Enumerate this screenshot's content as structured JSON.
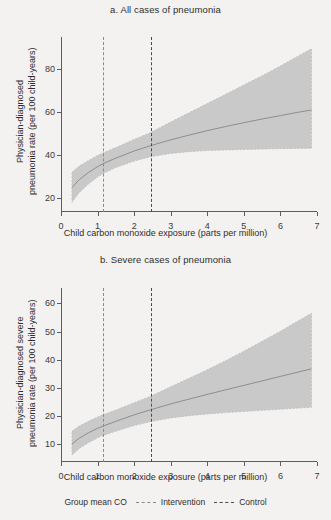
{
  "figure": {
    "background": "#f3f2f0",
    "band_color": "#c9c9c9",
    "line_color": "#8e8e8e",
    "axis_color": "#5d5d5d"
  },
  "legend": {
    "title": "Group mean CO",
    "items": [
      {
        "label": "Intervention",
        "style": "dashed",
        "color": "#8a8a8a"
      },
      {
        "label": "Control",
        "style": "dashed",
        "color": "#4a4a4a"
      }
    ]
  },
  "chart_data": [
    {
      "type": "line",
      "panel": "a",
      "title": "a. All cases of pneumonia",
      "xlabel": "Child carbon monoxide exposure (parts per million)",
      "ylabel": "Physician-diagnosed\npneumonia rate (per 100 child-years)",
      "xlim": [
        0,
        7
      ],
      "ylim": [
        13.5,
        95
      ],
      "xticks": [
        "0",
        "1",
        "2",
        "3",
        "4",
        "5",
        "6",
        "7"
      ],
      "yticks": [
        "20",
        "40",
        "60",
        "80"
      ],
      "grid": false,
      "legend_position": "bottom",
      "x": [
        0.3,
        0.5,
        0.75,
        1.0,
        1.15,
        1.5,
        2.0,
        2.45,
        3.0,
        3.5,
        4.0,
        4.5,
        5.0,
        5.5,
        6.0,
        6.5,
        6.85
      ],
      "series": [
        {
          "name": "Adjusted mean pneumonia rate",
          "values": [
            24.8,
            28.6,
            31.9,
            34.6,
            36.0,
            38.6,
            41.9,
            44.4,
            47.1,
            49.3,
            51.4,
            53.3,
            55.1,
            56.8,
            58.4,
            60.0,
            61.0
          ]
        },
        {
          "name": "95% CI lower",
          "values": [
            18.0,
            22.6,
            26.5,
            29.8,
            31.4,
            34.2,
            37.2,
            39.2,
            40.8,
            41.6,
            42.1,
            42.4,
            42.6,
            42.8,
            43.0,
            43.1,
            43.2
          ]
        },
        {
          "name": "95% CI upper",
          "values": [
            32.0,
            34.9,
            37.5,
            39.8,
            41.0,
            43.5,
            47.3,
            50.5,
            55.4,
            59.7,
            64.0,
            68.3,
            72.6,
            77.0,
            81.5,
            86.3,
            89.5
          ]
        }
      ],
      "reference_lines": [
        {
          "label": "Intervention",
          "value": 1.15,
          "style": "dashed"
        },
        {
          "label": "Control",
          "value": 2.45,
          "style": "dashed"
        }
      ]
    },
    {
      "type": "line",
      "panel": "b",
      "title": "b. Severe cases of pneumonia",
      "xlabel": "Child carbon monoxide exposure (parts per million)",
      "ylabel": "Physician-diagnosed severe\npneumonia rate (per 100 child-years)",
      "xlim": [
        0,
        7
      ],
      "ylim": [
        3.5,
        65.5
      ],
      "xticks": [
        "0",
        "1",
        "2",
        "3",
        "4",
        "5",
        "6",
        "7"
      ],
      "yticks": [
        "10",
        "20",
        "30",
        "40",
        "50",
        "60"
      ],
      "grid": false,
      "legend_position": "bottom",
      "x": [
        0.3,
        0.5,
        0.75,
        1.0,
        1.15,
        1.5,
        2.0,
        2.45,
        3.0,
        3.5,
        4.0,
        4.5,
        5.0,
        5.5,
        6.0,
        6.5,
        6.85
      ],
      "series": [
        {
          "name": "Adjusted mean severe pneumonia rate",
          "values": [
            9.9,
            12.0,
            13.9,
            15.5,
            16.3,
            18.0,
            20.3,
            22.1,
            24.2,
            25.9,
            27.6,
            29.2,
            30.8,
            32.4,
            34.0,
            35.6,
            36.7
          ]
        },
        {
          "name": "95% CI lower",
          "values": [
            6.0,
            8.3,
            10.4,
            12.1,
            12.9,
            14.5,
            16.5,
            17.9,
            19.2,
            20.0,
            20.6,
            21.1,
            21.5,
            21.9,
            22.3,
            22.7,
            23.0
          ]
        },
        {
          "name": "95% CI upper",
          "values": [
            14.5,
            16.3,
            18.0,
            19.5,
            20.3,
            22.0,
            24.6,
            26.9,
            30.3,
            33.3,
            36.4,
            39.6,
            43.0,
            46.5,
            50.1,
            53.9,
            56.5
          ]
        }
      ],
      "reference_lines": [
        {
          "label": "Intervention",
          "value": 1.15,
          "style": "dashed"
        },
        {
          "label": "Control",
          "value": 2.45,
          "style": "dashed"
        }
      ]
    }
  ]
}
